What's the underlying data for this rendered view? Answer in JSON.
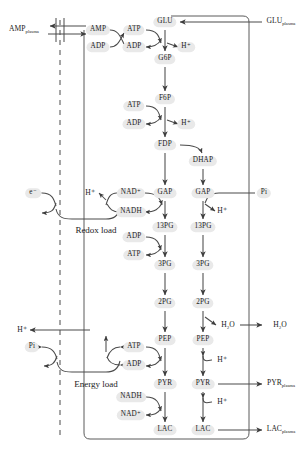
{
  "diagram": {
    "type": "biochemical-pathway",
    "colors": {
      "node_fill": "#e9e9e9",
      "stroke": "#4a4a4a",
      "text": "#1b1b1b",
      "background": "#ffffff"
    },
    "compartment_labels": {
      "redox_load": "Redox load",
      "energy_load": "Energy load"
    },
    "external_labels": [
      {
        "id": "amp-plasma",
        "text": "AMP",
        "sub": "plasma",
        "side": "left"
      },
      {
        "id": "glu-plasma",
        "text": "GLU",
        "sub": "plasma",
        "side": "right"
      },
      {
        "id": "pi-right",
        "text": "Pi",
        "sub": "",
        "side": "right"
      },
      {
        "id": "h2o-plasma",
        "text": "H₂O",
        "sub": "",
        "side": "right"
      },
      {
        "id": "pyr-plasma",
        "text": "PYR",
        "sub": "plasma",
        "side": "right"
      },
      {
        "id": "lac-plasma",
        "text": "LAC",
        "sub": "plasma",
        "side": "right"
      },
      {
        "id": "electron-left",
        "text": "e⁻",
        "sub": "",
        "side": "left"
      },
      {
        "id": "h-left-redox",
        "text": "H⁺",
        "sub": "",
        "side": "left"
      },
      {
        "id": "h-left-energy",
        "text": "H⁺",
        "sub": "",
        "side": "left"
      },
      {
        "id": "pi-left",
        "text": "Pi",
        "sub": "",
        "side": "left"
      }
    ],
    "metabolites": [
      {
        "id": "glu",
        "label": "GLU",
        "x": 165,
        "y": 22,
        "column": "main"
      },
      {
        "id": "g6p",
        "label": "G6P",
        "x": 165,
        "y": 59,
        "column": "main"
      },
      {
        "id": "f6p",
        "label": "F6P",
        "x": 165,
        "y": 99,
        "column": "main"
      },
      {
        "id": "fdp",
        "label": "FDP",
        "x": 165,
        "y": 145,
        "column": "main"
      },
      {
        "id": "dhap",
        "label": "DHAP",
        "x": 203,
        "y": 161,
        "column": "right"
      },
      {
        "id": "gap-l",
        "label": "GAP",
        "x": 165,
        "y": 193,
        "column": "main"
      },
      {
        "id": "gap-r",
        "label": "GAP",
        "x": 203,
        "y": 193,
        "column": "right"
      },
      {
        "id": "13pg-l",
        "label": "13PG",
        "x": 165,
        "y": 227,
        "column": "main"
      },
      {
        "id": "13pg-r",
        "label": "13PG",
        "x": 203,
        "y": 227,
        "column": "right"
      },
      {
        "id": "3pg-l",
        "label": "3PG",
        "x": 165,
        "y": 265,
        "column": "main"
      },
      {
        "id": "3pg-r",
        "label": "3PG",
        "x": 203,
        "y": 265,
        "column": "right"
      },
      {
        "id": "2pg-l",
        "label": "2PG",
        "x": 165,
        "y": 303,
        "column": "main"
      },
      {
        "id": "2pg-r",
        "label": "2PG",
        "x": 203,
        "y": 303,
        "column": "right"
      },
      {
        "id": "pep-l",
        "label": "PEP",
        "x": 165,
        "y": 340,
        "column": "main"
      },
      {
        "id": "pep-r",
        "label": "PEP",
        "x": 203,
        "y": 340,
        "column": "right"
      },
      {
        "id": "pyr-l",
        "label": "PYR",
        "x": 165,
        "y": 384,
        "column": "main"
      },
      {
        "id": "pyr-r",
        "label": "PYR",
        "x": 203,
        "y": 384,
        "column": "right"
      },
      {
        "id": "lac-l",
        "label": "LAC",
        "x": 165,
        "y": 430,
        "column": "main"
      },
      {
        "id": "lac-r",
        "label": "LAC",
        "x": 203,
        "y": 430,
        "column": "right"
      }
    ],
    "cofactors": [
      {
        "id": "amp",
        "label": "AMP",
        "x": 98,
        "y": 30
      },
      {
        "id": "adp-amp",
        "label": "ADP",
        "x": 98,
        "y": 47
      },
      {
        "id": "atp-hk",
        "label": "ATP",
        "x": 134,
        "y": 30
      },
      {
        "id": "adp-hk",
        "label": "ADP",
        "x": 134,
        "y": 47
      },
      {
        "id": "h-hk",
        "label": "H⁺",
        "x": 186,
        "y": 47
      },
      {
        "id": "atp-pfk",
        "label": "ATP",
        "x": 134,
        "y": 106
      },
      {
        "id": "adp-pfk",
        "label": "ADP",
        "x": 134,
        "y": 124
      },
      {
        "id": "h-pfk",
        "label": "H⁺",
        "x": 186,
        "y": 124
      },
      {
        "id": "nad-gapdh",
        "label": "NAD⁺",
        "x": 131,
        "y": 193
      },
      {
        "id": "nadh-gapdh",
        "label": "NADH",
        "x": 131,
        "y": 212
      },
      {
        "id": "h-redox",
        "label": "H⁺",
        "x": 90,
        "y": 193
      },
      {
        "id": "h-gap-r",
        "label": "H⁺",
        "x": 222,
        "y": 211
      },
      {
        "id": "adp-pgk",
        "label": "ADP",
        "x": 134,
        "y": 237
      },
      {
        "id": "atp-pgk",
        "label": "ATP",
        "x": 134,
        "y": 255
      },
      {
        "id": "h2o-eno",
        "label": "H₂O",
        "x": 228,
        "y": 325
      },
      {
        "id": "atp-pk",
        "label": "ATP",
        "x": 134,
        "y": 347
      },
      {
        "id": "adp-pk",
        "label": "ADP",
        "x": 134,
        "y": 365
      },
      {
        "id": "h-pep-r",
        "label": "H⁺",
        "x": 222,
        "y": 360
      },
      {
        "id": "nadh-ldh",
        "label": "NADH",
        "x": 131,
        "y": 397
      },
      {
        "id": "nad-ldh",
        "label": "NAD⁺",
        "x": 131,
        "y": 415
      },
      {
        "id": "h-pyr-r",
        "label": "H⁺",
        "x": 222,
        "y": 402
      }
    ],
    "reactions": [
      {
        "from": "glu",
        "to": "g6p",
        "enzyme": "hexokinase",
        "reversible": false
      },
      {
        "from": "g6p",
        "to": "f6p",
        "enzyme": "phosphoglucoisomerase",
        "reversible": false
      },
      {
        "from": "f6p",
        "to": "fdp",
        "enzyme": "phosphofructokinase",
        "reversible": false
      },
      {
        "from": "fdp",
        "to": "gap-l",
        "enzyme": "aldolase",
        "reversible": false
      },
      {
        "from": "fdp",
        "to": "dhap",
        "enzyme": "aldolase",
        "reversible": false
      },
      {
        "from": "dhap",
        "to": "gap-r",
        "enzyme": "triose-phosphate-isomerase",
        "reversible": false
      },
      {
        "from": "gap-l",
        "to": "13pg-l",
        "enzyme": "GAPDH",
        "reversible": false
      },
      {
        "from": "gap-r",
        "to": "13pg-r",
        "enzyme": "GAPDH",
        "reversible": false
      },
      {
        "from": "13pg-l",
        "to": "3pg-l",
        "enzyme": "phosphoglycerate-kinase",
        "reversible": false
      },
      {
        "from": "13pg-r",
        "to": "3pg-r",
        "enzyme": "phosphoglycerate-kinase",
        "reversible": false
      },
      {
        "from": "3pg-l",
        "to": "2pg-l",
        "enzyme": "phosphoglycerate-mutase",
        "reversible": false
      },
      {
        "from": "3pg-r",
        "to": "2pg-r",
        "enzyme": "phosphoglycerate-mutase",
        "reversible": false
      },
      {
        "from": "2pg-l",
        "to": "pep-l",
        "enzyme": "enolase",
        "reversible": false
      },
      {
        "from": "2pg-r",
        "to": "pep-r",
        "enzyme": "enolase",
        "reversible": false
      },
      {
        "from": "pep-l",
        "to": "pyr-l",
        "enzyme": "pyruvate-kinase",
        "reversible": false
      },
      {
        "from": "pep-r",
        "to": "pyr-r",
        "enzyme": "pyruvate-kinase",
        "reversible": false
      },
      {
        "from": "pyr-l",
        "to": "lac-l",
        "enzyme": "lactate-dehydrogenase",
        "reversible": false
      },
      {
        "from": "pyr-r",
        "to": "lac-r",
        "enzyme": "lactate-dehydrogenase",
        "reversible": false
      }
    ],
    "transports": [
      {
        "species": "GLU",
        "direction": "in",
        "label": "GLU plasma to GLU"
      },
      {
        "species": "AMP",
        "direction": "out",
        "label": "AMP to AMP plasma",
        "reversible": true
      },
      {
        "species": "Pi",
        "direction": "in",
        "label": "Pi plasma to GAP"
      },
      {
        "species": "H2O",
        "direction": "out",
        "label": "H2O to H2O plasma"
      },
      {
        "species": "PYR",
        "direction": "out",
        "label": "PYR to PYR plasma"
      },
      {
        "species": "LAC",
        "direction": "out",
        "label": "LAC to LAC plasma"
      }
    ]
  }
}
